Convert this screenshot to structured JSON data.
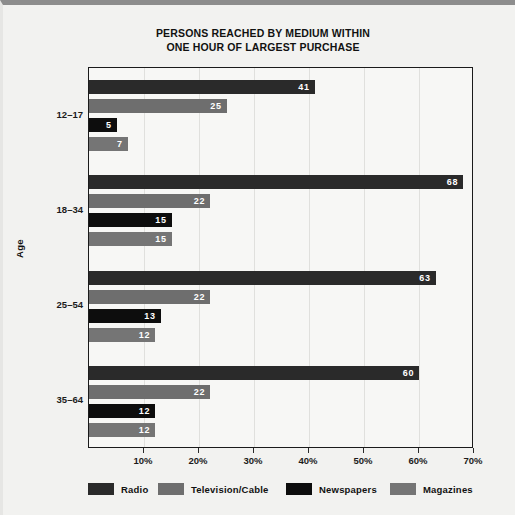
{
  "chart_data": {
    "type": "bar",
    "orientation": "horizontal",
    "title": "PERSONS REACHED BY MEDIUM WITHIN ONE HOUR OF LARGEST PURCHASE",
    "title_lines": [
      "PERSONS REACHED BY MEDIUM WITHIN",
      "ONE HOUR OF LARGEST PURCHASE"
    ],
    "xlabel": "",
    "ylabel": "Age",
    "categories": [
      "12–17",
      "18–34",
      "25–54",
      "35–64"
    ],
    "series": [
      {
        "name": "Radio",
        "color": "#2a2a2a",
        "values": [
          41,
          68,
          63,
          60
        ]
      },
      {
        "name": "Television/Cable",
        "color": "#6e6e6e",
        "values": [
          25,
          22,
          22,
          22
        ]
      },
      {
        "name": "Newspapers",
        "color": "#0d0d0d",
        "values": [
          5,
          15,
          13,
          12
        ]
      },
      {
        "name": "Magazines",
        "color": "#757575",
        "values": [
          7,
          15,
          12,
          12
        ]
      }
    ],
    "xlim": [
      0,
      70
    ],
    "xticks": [
      0,
      10,
      20,
      30,
      40,
      50,
      60,
      70
    ],
    "xtick_labels": [
      "",
      "10%",
      "20%",
      "30%",
      "40%",
      "50%",
      "60%",
      "70%"
    ],
    "grid": true,
    "legend_position": "bottom",
    "value_labels_inside": true
  },
  "legend": {
    "items": [
      {
        "label": "Radio",
        "color": "#2a2a2a"
      },
      {
        "label": "Television/Cable",
        "color": "#6e6e6e"
      },
      {
        "label": "Newspapers",
        "color": "#0d0d0d"
      },
      {
        "label": "Magazines",
        "color": "#757575"
      }
    ]
  }
}
